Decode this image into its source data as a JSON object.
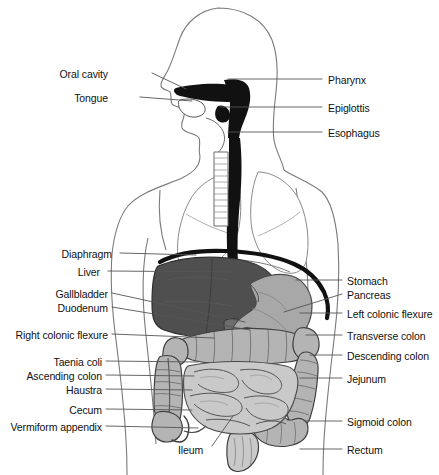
{
  "figure": {
    "view": "anterior torso with left-facing head profile",
    "background_color": "#ffffff"
  },
  "palette": {
    "outline": "#4a4a4a",
    "body_outline": "#6e6e6e",
    "pharynx_dark": "#111111",
    "liver": "#4f4f4f",
    "stomach": "#a8a8a8",
    "colon": "#b4b4b4",
    "small_intestine": "#c9c9c9",
    "pancreas": "#d8d8d8",
    "lung": "#ffffff",
    "label_text": "#111111",
    "leader_line": "#555555"
  },
  "labels_left": [
    {
      "id": "oral-cavity",
      "text": "Oral cavity",
      "text_x": 108,
      "text_y": 76,
      "anchor_x": 186,
      "anchor_y": 91
    },
    {
      "id": "tongue",
      "text": "Tongue",
      "text_x": 108,
      "text_y": 100,
      "anchor_x": 190,
      "anchor_y": 101
    },
    {
      "id": "diaphragm",
      "text": "Diaphragm",
      "text_x": 112,
      "text_y": 256,
      "anchor_x": 196,
      "anchor_y": 256
    },
    {
      "id": "liver",
      "text": "Liver",
      "text_x": 112,
      "text_y": 274,
      "anchor_x": 230,
      "anchor_y": 274
    },
    {
      "id": "gallbladder",
      "text": "Gallbladder",
      "text_x": 108,
      "text_y": 296,
      "anchor_x": 243,
      "anchor_y": 322
    },
    {
      "id": "duodenum",
      "text": "Duodenum",
      "text_x": 108,
      "text_y": 310,
      "anchor_x": 252,
      "anchor_y": 327
    },
    {
      "id": "right-colonic-flexure",
      "text": "Right colonic flexure",
      "text_x": 108,
      "text_y": 337,
      "anchor_x": 215,
      "anchor_y": 339
    },
    {
      "id": "taenia-coli",
      "text": "Taenia coli",
      "text_x": 108,
      "text_y": 364,
      "anchor_x": 199,
      "anchor_y": 364
    },
    {
      "id": "ascending-colon",
      "text": "Ascending colon",
      "text_x": 108,
      "text_y": 378,
      "anchor_x": 195,
      "anchor_y": 378
    },
    {
      "id": "haustra",
      "text": "Haustra",
      "text_x": 108,
      "text_y": 392,
      "anchor_x": 194,
      "anchor_y": 392
    },
    {
      "id": "cecum",
      "text": "Cecum",
      "text_x": 108,
      "text_y": 412,
      "anchor_x": 193,
      "anchor_y": 412
    },
    {
      "id": "vermiform-appendix",
      "text": "Vermiform appendix",
      "text_x": 108,
      "text_y": 429,
      "anchor_x": 199,
      "anchor_y": 429
    }
  ],
  "labels_right": [
    {
      "id": "pharynx",
      "text": "Pharynx",
      "text_x": 328,
      "text_y": 82,
      "anchor_x": 228,
      "anchor_y": 82
    },
    {
      "id": "epiglottis",
      "text": "Epiglottis",
      "text_x": 328,
      "text_y": 110,
      "anchor_x": 220,
      "anchor_y": 110
    },
    {
      "id": "esophagus",
      "text": "Esophagus",
      "text_x": 328,
      "text_y": 135,
      "anchor_x": 228,
      "anchor_y": 135
    },
    {
      "id": "stomach",
      "text": "Stomach",
      "text_x": 348,
      "text_y": 283,
      "anchor_x": 300,
      "anchor_y": 283
    },
    {
      "id": "pancreas",
      "text": "Pancreas",
      "text_x": 348,
      "text_y": 297,
      "anchor_x": 288,
      "anchor_y": 312
    },
    {
      "id": "left-colonic-flexure",
      "text": "Left colonic flexure",
      "text_x": 348,
      "text_y": 316,
      "anchor_x": 305,
      "anchor_y": 316
    },
    {
      "id": "transverse-colon",
      "text": "Transverse colon",
      "text_x": 348,
      "text_y": 338,
      "anchor_x": 310,
      "anchor_y": 338
    },
    {
      "id": "descending-colon",
      "text": "Descending colon",
      "text_x": 348,
      "text_y": 358,
      "anchor_x": 312,
      "anchor_y": 358
    },
    {
      "id": "jejunum",
      "text": "Jejunum",
      "text_x": 348,
      "text_y": 381,
      "anchor_x": 305,
      "anchor_y": 381
    },
    {
      "id": "sigmoid-colon",
      "text": "Sigmoid colon",
      "text_x": 348,
      "text_y": 424,
      "anchor_x": 308,
      "anchor_y": 424
    },
    {
      "id": "rectum",
      "text": "Rectum",
      "text_x": 348,
      "text_y": 452,
      "anchor_x": 305,
      "anchor_y": 452
    }
  ],
  "labels_inline": [
    {
      "id": "ileum",
      "text": "Ileum",
      "text_x": 178,
      "text_y": 452,
      "anchor_x": 233,
      "anchor_y": 418
    }
  ],
  "organs": [
    {
      "id": "head-profile",
      "name": "head profile outline",
      "fill": "#ffffff"
    },
    {
      "id": "oral-cavity",
      "name": "oral cavity",
      "fill": "#111111"
    },
    {
      "id": "tongue",
      "name": "tongue",
      "fill": "#ffffff"
    },
    {
      "id": "pharynx",
      "name": "pharynx",
      "fill": "#111111"
    },
    {
      "id": "epiglottis",
      "name": "epiglottis",
      "fill": "#111111"
    },
    {
      "id": "esophagus",
      "name": "esophagus",
      "fill": "#111111"
    },
    {
      "id": "trachea",
      "name": "trachea",
      "fill": "#ffffff"
    },
    {
      "id": "lung-right",
      "name": "right lung",
      "fill": "#ffffff"
    },
    {
      "id": "lung-left",
      "name": "left lung",
      "fill": "#ffffff"
    },
    {
      "id": "diaphragm",
      "name": "diaphragm",
      "fill": "#111111"
    },
    {
      "id": "liver",
      "name": "liver",
      "fill": "#4f4f4f"
    },
    {
      "id": "gallbladder",
      "name": "gallbladder",
      "fill": "#6a6a6a"
    },
    {
      "id": "stomach",
      "name": "stomach",
      "fill": "#a8a8a8"
    },
    {
      "id": "pancreas",
      "name": "pancreas",
      "fill": "#d8d8d8"
    },
    {
      "id": "duodenum",
      "name": "duodenum",
      "fill": "#c2c2c2"
    },
    {
      "id": "transverse-colon",
      "name": "transverse colon",
      "fill": "#b4b4b4"
    },
    {
      "id": "ascending-colon",
      "name": "ascending colon",
      "fill": "#b4b4b4"
    },
    {
      "id": "descending-colon",
      "name": "descending colon",
      "fill": "#b4b4b4"
    },
    {
      "id": "sigmoid-colon",
      "name": "sigmoid colon",
      "fill": "#b4b4b4"
    },
    {
      "id": "cecum",
      "name": "cecum",
      "fill": "#b4b4b4"
    },
    {
      "id": "appendix",
      "name": "vermiform appendix",
      "fill": "#ffffff"
    },
    {
      "id": "small-intestine",
      "name": "small intestine",
      "fill": "#c9c9c9"
    },
    {
      "id": "rectum",
      "name": "rectum",
      "fill": "#c9c9c9"
    }
  ]
}
